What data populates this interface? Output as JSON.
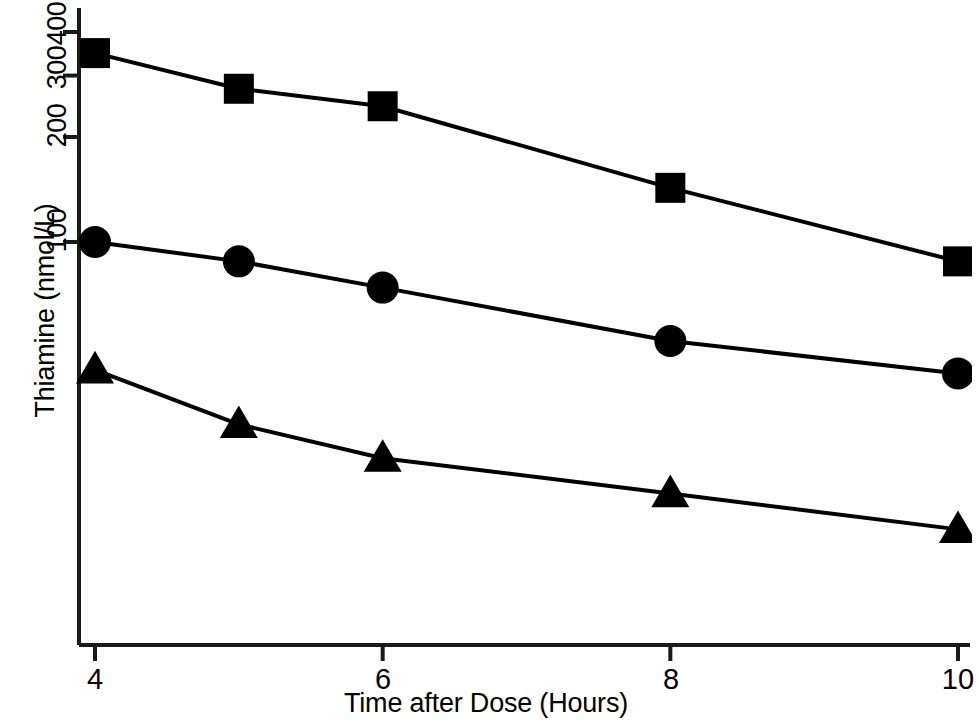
{
  "chart_data": {
    "type": "line",
    "title": "",
    "xlabel": "Time after Dose (Hours)",
    "ylabel": "Thiamine (nmol/L)",
    "yscale": "log",
    "xticks": [
      "4",
      "6",
      "8",
      "10"
    ],
    "xtick_values": [
      4,
      6,
      8,
      10
    ],
    "yticks": [
      "100",
      "200",
      "300",
      "400"
    ],
    "ytick_values": [
      100,
      200,
      300,
      400
    ],
    "xlim": [
      4,
      10
    ],
    "ylim": [
      12,
      460
    ],
    "grid": false,
    "legend": "none",
    "x": [
      4,
      5,
      6,
      8,
      10
    ],
    "series": [
      {
        "name": "High dose",
        "marker": "square",
        "color": "#000000",
        "values": [
          348,
          275,
          245,
          143,
          88
        ]
      },
      {
        "name": "Mid dose",
        "marker": "circle",
        "color": "#000000",
        "values": [
          100,
          88,
          74,
          52,
          42
        ]
      },
      {
        "name": "Low dose",
        "marker": "triangle",
        "color": "#000000",
        "values": [
          43,
          30,
          24,
          19,
          15
        ]
      }
    ]
  },
  "axes": {
    "y_tick_labels": [
      {
        "text": "400",
        "top": 8,
        "left": 36
      },
      {
        "text": "300",
        "top": 52,
        "left": 36
      },
      {
        "text": "200",
        "top": 110,
        "left": 36
      },
      {
        "text": "100",
        "top": 215,
        "left": 36
      }
    ],
    "x_tick_labels": [
      {
        "text": "4",
        "left": 95
      },
      {
        "text": "6",
        "left": 383
      },
      {
        "text": "8",
        "left": 671
      },
      {
        "text": "10",
        "left": 958
      }
    ]
  }
}
